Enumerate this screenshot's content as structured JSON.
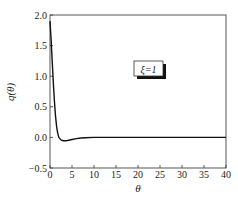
{
  "chart_data": {
    "type": "line",
    "title": "",
    "xlabel": "θ",
    "ylabel": "q(θ)",
    "xlim": [
      0,
      40
    ],
    "ylim": [
      -0.5,
      2.0
    ],
    "xticks": [
      0,
      5,
      10,
      15,
      20,
      25,
      30,
      35,
      40
    ],
    "yticks": [
      -0.5,
      0.0,
      0.5,
      1.0,
      1.5,
      2.0
    ],
    "xtick_labels": [
      "0",
      "5",
      "10",
      "15",
      "20",
      "25",
      "30",
      "35",
      "40"
    ],
    "ytick_labels": [
      "−0.5",
      "0.0",
      "0.5",
      "1.0",
      "1.5",
      "2.0"
    ],
    "grid": false,
    "annotation": "ξ=1",
    "series": [
      {
        "name": "q(θ), ξ=1",
        "color": "#111111",
        "x": [
          0,
          0.25,
          0.5,
          0.75,
          1.0,
          1.25,
          1.5,
          1.75,
          2.0,
          2.5,
          3.0,
          3.5,
          4.0,
          5.0,
          6.0,
          7.0,
          8.0,
          10.0,
          15.0,
          20.0,
          25.0,
          30.0,
          35.0,
          40.0
        ],
        "y": [
          1.9,
          1.6,
          1.25,
          0.9,
          0.6,
          0.35,
          0.18,
          0.07,
          0.0,
          -0.04,
          -0.055,
          -0.055,
          -0.05,
          -0.035,
          -0.02,
          -0.01,
          -0.005,
          0.0,
          0.0,
          0.0,
          0.0,
          0.0,
          0.0,
          0.0
        ]
      }
    ]
  }
}
